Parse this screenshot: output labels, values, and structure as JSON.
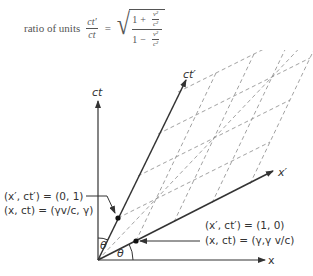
{
  "formula": {
    "prefix": "ratio of units",
    "lhs_num": "ct′",
    "lhs_den": "ct",
    "equals": "=",
    "num_one": "1",
    "num_op": "+",
    "den_one": "1",
    "den_op": "−",
    "v2": "v²",
    "c2": "c²"
  },
  "axes": {
    "ct": "ct",
    "x": "x",
    "ct_prime": "ct′",
    "x_prime": "x′"
  },
  "angles": {
    "theta": "θ"
  },
  "annotations": {
    "point_ct_prime_primed": "(x′, ct′) = (0, 1)",
    "point_ct_prime_unprimed": "(x, ct) = (γv/c, γ)",
    "point_x_prime_primed": "(x′, ct′) = (1, 0)",
    "point_x_prime_unprimed": "(x, ct) = (γ,γ v/c)"
  },
  "colors": {
    "axis": "#333333",
    "grid": "#888888",
    "text": "#333333"
  }
}
